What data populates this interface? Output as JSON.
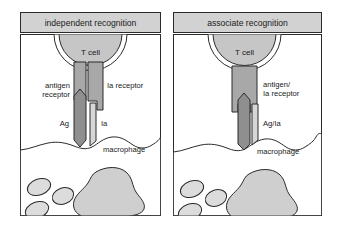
{
  "figure": {
    "type": "biology-schematic-diagram",
    "panel_count": 2,
    "colors": {
      "outline": "#2b2b2b",
      "title_bar_fill": "#d2d2d2",
      "t_cell_fill": "#c6c6c6",
      "receptor_fill": "#a8a8a8",
      "ag_fill": "#8f8f8f",
      "ia_fill": "#d6d6d6",
      "macrophage_fill": "#ffffff",
      "nucleus_fill": "#cfcfcf",
      "vacuole_fill": "#dcdcdc",
      "background": "#ffffff"
    }
  },
  "panels": [
    {
      "id": "independent",
      "title": "independent recognition",
      "cell_label": "T cell",
      "macrophage_label": "macrophage",
      "receptors": [
        {
          "name": "antigen-receptor",
          "label": "antigen\nreceptor",
          "label_line_1": "antigen",
          "label_line_2": "receptor",
          "side": "left"
        },
        {
          "name": "ia-receptor",
          "label": "Ia receptor",
          "side": "right"
        }
      ],
      "ligands": [
        {
          "name": "ag-ligand",
          "label": "Ag",
          "side": "left"
        },
        {
          "name": "ia-ligand",
          "label": "Ia",
          "side": "right"
        }
      ]
    },
    {
      "id": "associate",
      "title": "associate recognition",
      "cell_label": "T cell",
      "macrophage_label": "macrophage",
      "receptors": [
        {
          "name": "antigen-ia-receptor",
          "label": "antigen/\nIa receptor",
          "label_line_1": "antigen/",
          "label_line_2": "Ia receptor",
          "side": "right"
        }
      ],
      "ligands": [
        {
          "name": "ag-ia-ligand",
          "label": "Ag/Ia",
          "side": "right"
        }
      ]
    }
  ]
}
